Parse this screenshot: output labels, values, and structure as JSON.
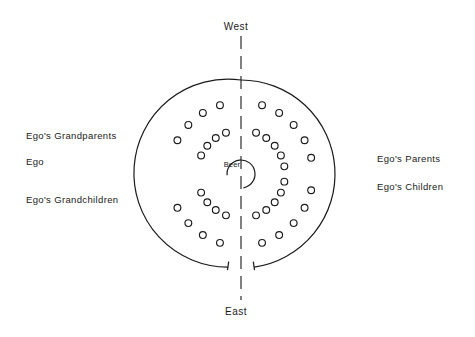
{
  "figure": {
    "type": "diagram",
    "title_visible": false,
    "background_color": "#ffffff",
    "stroke_color": "#1a1a1a",
    "compass": {
      "top_label": "West",
      "bottom_label": "East"
    },
    "center": {
      "label": "Beer",
      "shape": "circle-with-gap",
      "cx": 241,
      "cy": 174,
      "r": 14,
      "gap_start_deg": 170,
      "gap_end_deg": 265
    },
    "axis": {
      "name": "west-east-dashed-axis",
      "orientation": "vertical",
      "x": 241,
      "y_top": 36,
      "y_bottom": 300,
      "style": "dashed"
    },
    "outer_boundary": {
      "name": "seating-circle",
      "cx": 241,
      "cy": 174,
      "r": 94,
      "split": "two-arcs-open-at-bottom",
      "terminator": "perpendicular-tick"
    },
    "left_labels": [
      {
        "id": "grandparents",
        "text": "Ego's Grandparents"
      },
      {
        "id": "ego",
        "text": "Ego"
      },
      {
        "id": "grandchildren",
        "text": "Ego's Grandchildren"
      }
    ],
    "right_labels": [
      {
        "id": "parents",
        "text": "Ego's Parents"
      },
      {
        "id": "children",
        "text": "Ego's Children"
      }
    ],
    "seats": {
      "marker": "open-circle",
      "radius_px": 3.4,
      "rings": [
        {
          "name": "inner-ring",
          "ring_radius": 44,
          "count_per_side": 9,
          "angles_deg_west_half": [
            100,
            115,
            130,
            145,
            160,
            200,
            215,
            230,
            245
          ],
          "angles_deg_east_half": [
            80,
            65,
            50,
            35,
            20,
            340,
            325,
            310,
            295
          ]
        },
        {
          "name": "outer-ring",
          "ring_radius": 72,
          "count_per_side": 9,
          "angles_deg_west_half": [
            103,
            118,
            133,
            148,
            163,
            197,
            212,
            227,
            242
          ],
          "angles_deg_east_half": [
            77,
            62,
            47,
            32,
            17,
            343,
            328,
            313,
            298
          ]
        }
      ],
      "total_seats": 36
    }
  }
}
